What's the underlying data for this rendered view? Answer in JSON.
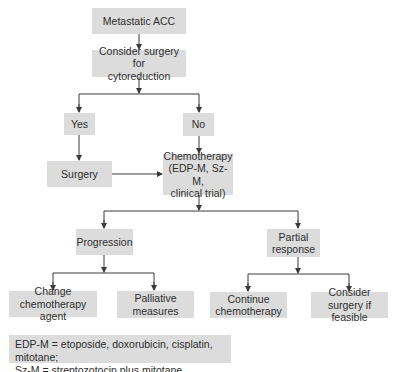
{
  "diagram": {
    "nodes": {
      "metastatic": "Metastatic ACC",
      "consider_surgery": "Consider surgery for\ncytoreduction",
      "yes": "Yes",
      "no": "No",
      "surgery": "Surgery",
      "chemotherapy": "Chemotherapy\n(EDP-M, Sz-M,\nclinical trial)",
      "progression": "Progression",
      "partial_response": "Partial\nresponse",
      "change_agent": "Change\nchemotherapy agent",
      "palliative": "Palliative\nmeasures",
      "continue_chemo": "Continue\nchemotherapy",
      "consider_surgery_feasible": "Consider\nsurgery if feasible"
    },
    "legend": "EDP-M = etoposide, doxorubicin, cisplatin, mitotane;\nSz-M = streptozotocin plus mitotane",
    "colors": {
      "box_fill": "#dcdcdc",
      "line": "#3a3a3a",
      "text": "#2e2e2e"
    }
  }
}
